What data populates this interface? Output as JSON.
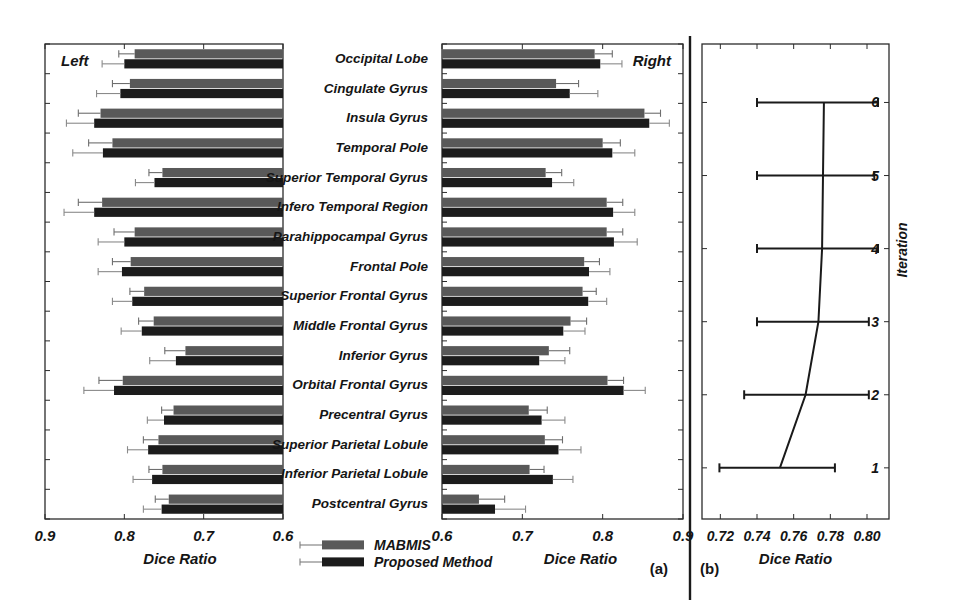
{
  "figure": {
    "panel_a_label": "(a)",
    "panel_b_label": "(b)",
    "side_left_label": "Left",
    "side_right_label": "Right"
  },
  "legend": {
    "items": [
      {
        "label": "MABMIS",
        "color": "#595959"
      },
      {
        "label": "Proposed Method",
        "color": "#1c1c1c"
      }
    ]
  },
  "chart_data": [
    {
      "id": "panel-a-left",
      "type": "bar",
      "orientation": "horizontal",
      "title": "Left",
      "xlabel": "Dice Ratio",
      "ylabel": "",
      "xlim": [
        0.9,
        0.6
      ],
      "reversed_axis": true,
      "xticks": [
        0.9,
        0.8,
        0.7,
        0.6
      ],
      "xticklabels": [
        "0.9",
        "0.8",
        "0.7",
        "0.6"
      ],
      "grid": false,
      "categories": [
        "Occipital Lobe",
        "Cingulate Gyrus",
        "Insula Gyrus",
        "Temporal Pole",
        "Superior Temporal Gyrus",
        "Infero Temporal Region",
        "Parahippocampal Gyrus",
        "Frontal Pole",
        "Superior Frontal Gyrus",
        "Middle Frontal Gyrus",
        "Inferior Gyrus",
        "Orbital Frontal Gyrus",
        "Precentral Gyrus",
        "Superior Parietal Lobule",
        "Inferior Parietal Lobule",
        "Postcentral Gyrus"
      ],
      "series": [
        {
          "name": "MABMIS",
          "color": "#595959",
          "values": [
            0.787,
            0.793,
            0.83,
            0.815,
            0.752,
            0.828,
            0.787,
            0.792,
            0.775,
            0.763,
            0.723,
            0.802,
            0.738,
            0.757,
            0.752,
            0.744
          ],
          "errors": [
            0.02,
            0.022,
            0.028,
            0.03,
            0.017,
            0.03,
            0.026,
            0.023,
            0.018,
            0.019,
            0.026,
            0.03,
            0.015,
            0.019,
            0.017,
            0.017
          ]
        },
        {
          "name": "Proposed Method",
          "color": "#1c1c1c",
          "values": [
            0.8,
            0.805,
            0.838,
            0.827,
            0.762,
            0.838,
            0.8,
            0.803,
            0.79,
            0.778,
            0.735,
            0.813,
            0.75,
            0.77,
            0.765,
            0.753
          ],
          "errors": [
            0.028,
            0.03,
            0.035,
            0.038,
            0.024,
            0.038,
            0.033,
            0.03,
            0.025,
            0.026,
            0.033,
            0.038,
            0.021,
            0.026,
            0.024,
            0.023
          ]
        }
      ]
    },
    {
      "id": "panel-a-right",
      "type": "bar",
      "orientation": "horizontal",
      "title": "Right",
      "xlabel": "Dice Ratio",
      "ylabel": "",
      "xlim": [
        0.6,
        0.9
      ],
      "reversed_axis": false,
      "xticks": [
        0.6,
        0.7,
        0.8,
        0.9
      ],
      "xticklabels": [
        "0.6",
        "0.7",
        "0.8",
        "0.9"
      ],
      "grid": false,
      "categories": [
        "Occipital Lobe",
        "Cingulate Gyrus",
        "Insula Gyrus",
        "Temporal Pole",
        "Superior Temporal Gyrus",
        "Infero Temporal Region",
        "Parahippocampal Gyrus",
        "Frontal Pole",
        "Superior Frontal Gyrus",
        "Middle Frontal Gyrus",
        "Inferior Gyrus",
        "Orbital Frontal Gyrus",
        "Precentral Gyrus",
        "Superior Parietal Lobule",
        "Inferior Parietal Lobule",
        "Postcentral Gyrus"
      ],
      "series": [
        {
          "name": "MABMIS",
          "color": "#595959",
          "values": [
            0.79,
            0.742,
            0.852,
            0.8,
            0.729,
            0.805,
            0.805,
            0.777,
            0.775,
            0.76,
            0.733,
            0.806,
            0.708,
            0.728,
            0.709,
            0.646
          ],
          "errors": [
            0.022,
            0.028,
            0.02,
            0.022,
            0.02,
            0.02,
            0.02,
            0.019,
            0.017,
            0.02,
            0.026,
            0.02,
            0.023,
            0.022,
            0.018,
            0.032
          ]
        },
        {
          "name": "Proposed Method",
          "color": "#1c1c1c",
          "values": [
            0.797,
            0.759,
            0.858,
            0.812,
            0.737,
            0.813,
            0.814,
            0.783,
            0.782,
            0.751,
            0.721,
            0.826,
            0.724,
            0.745,
            0.738,
            0.666
          ],
          "errors": [
            0.027,
            0.035,
            0.025,
            0.028,
            0.027,
            0.027,
            0.029,
            0.026,
            0.023,
            0.027,
            0.032,
            0.027,
            0.029,
            0.028,
            0.025,
            0.038
          ]
        }
      ]
    },
    {
      "id": "panel-b",
      "type": "line",
      "orientation": "horizontal",
      "title": "",
      "xlabel": "Dice Ratio",
      "ylabel": "Iteration",
      "xlim": [
        0.71,
        0.812
      ],
      "ylim": [
        0.3,
        6.8
      ],
      "xticks": [
        0.72,
        0.74,
        0.76,
        0.78,
        0.8
      ],
      "xticklabels": [
        "0.72",
        "0.74",
        "0.76",
        "0.78",
        "0.80"
      ],
      "yticks": [
        1,
        2,
        3,
        4,
        5,
        6
      ],
      "yticklabels": [
        "1",
        "2",
        "3",
        "4",
        "5",
        "6"
      ],
      "grid": false,
      "points": [
        {
          "iteration": 1,
          "mean": 0.7525,
          "err_low": 0.7195,
          "err_high": 0.7825
        },
        {
          "iteration": 2,
          "mean": 0.7665,
          "err_low": 0.733,
          "err_high": 0.801
        },
        {
          "iteration": 3,
          "mean": 0.7735,
          "err_low": 0.74,
          "err_high": 0.801
        },
        {
          "iteration": 4,
          "mean": 0.7755,
          "err_low": 0.74,
          "err_high": 0.806
        },
        {
          "iteration": 5,
          "mean": 0.776,
          "err_low": 0.74,
          "err_high": 0.804
        },
        {
          "iteration": 6,
          "mean": 0.7765,
          "err_low": 0.74,
          "err_high": 0.806
        }
      ]
    }
  ]
}
